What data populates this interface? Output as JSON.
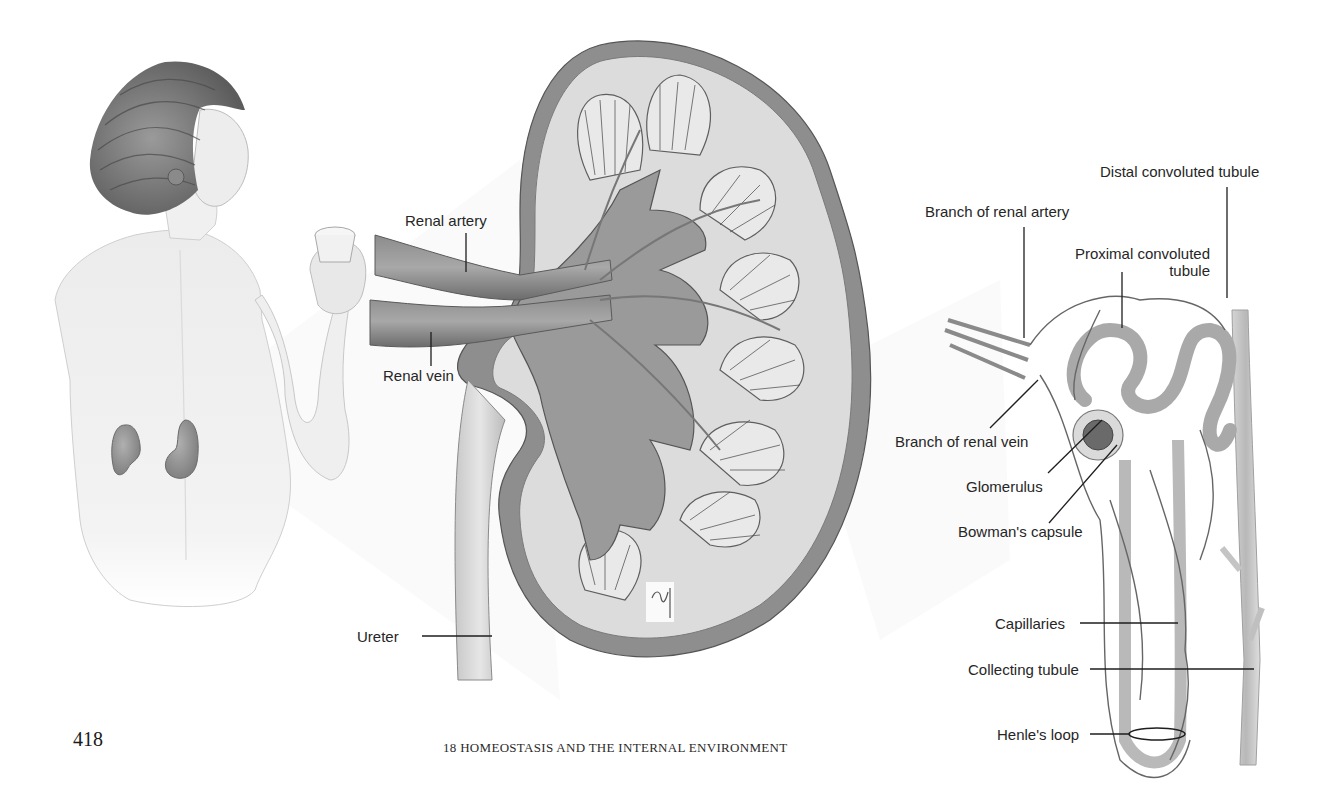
{
  "page": {
    "page_number": "418",
    "running_head": "18 HOMEOSTASIS AND THE INTERNAL ENVIRONMENT"
  },
  "figure": {
    "panels": [
      {
        "id": "woman-back",
        "description": "woman seen from behind holding a glass, kidneys visible on lower back"
      },
      {
        "id": "kidney-section",
        "description": "longitudinal section of kidney"
      },
      {
        "id": "nephron",
        "description": "single nephron with blood vessels"
      }
    ],
    "kidney_labels": {
      "renal_artery": "Renal artery",
      "renal_vein": "Renal vein",
      "ureter": "Ureter"
    },
    "nephron_labels": {
      "distal_tubule": "Distal convoluted tubule",
      "branch_artery": "Branch of renal artery",
      "proximal_tubule_line1": "Proximal convoluted",
      "proximal_tubule_line2": "tubule",
      "branch_vein": "Branch of renal vein",
      "glomerulus": "Glomerulus",
      "bowmans_capsule": "Bowman's capsule",
      "capillaries": "Capillaries",
      "collecting_tubule": "Collecting tubule",
      "henles_loop": "Henle's loop"
    },
    "colors": {
      "ink": "#262626",
      "tissue_dark": "#6e6e6e",
      "tissue_mid": "#9a9a9a",
      "tissue_light": "#cfcfcf",
      "skin": "#ececec"
    }
  }
}
